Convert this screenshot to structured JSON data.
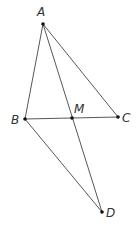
{
  "diagram": {
    "type": "geometry",
    "points": {
      "A": {
        "label": "A",
        "x": 43,
        "y": 24,
        "lx": 37,
        "ly": 16
      },
      "B": {
        "label": "B",
        "x": 25,
        "y": 119,
        "lx": 11,
        "ly": 124
      },
      "M": {
        "label": "M",
        "x": 72,
        "y": 118,
        "lx": 74,
        "ly": 113
      },
      "C": {
        "label": "C",
        "x": 118,
        "y": 117,
        "lx": 122,
        "ly": 122
      },
      "D": {
        "label": "D",
        "x": 102,
        "y": 212,
        "lx": 106,
        "ly": 217
      }
    },
    "segments": [
      [
        "A",
        "B"
      ],
      [
        "A",
        "C"
      ],
      [
        "A",
        "D"
      ],
      [
        "B",
        "C"
      ],
      [
        "B",
        "D"
      ]
    ],
    "colors": {
      "line": "#444444",
      "point": "#111111",
      "label": "#333333"
    }
  }
}
